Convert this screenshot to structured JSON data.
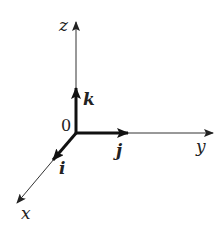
{
  "diagram": {
    "title": "",
    "origin_label": "0",
    "axes": [
      {
        "id": "z",
        "label": "z"
      },
      {
        "id": "y",
        "label": "y"
      },
      {
        "id": "x",
        "label": "x"
      }
    ],
    "unit_vectors": [
      {
        "id": "k",
        "label": "k",
        "along": "z"
      },
      {
        "id": "j",
        "label": "j",
        "along": "y"
      },
      {
        "id": "i",
        "label": "i",
        "along": "x"
      }
    ],
    "colors": {
      "stroke": "#222222",
      "background": "#ffffff"
    }
  }
}
